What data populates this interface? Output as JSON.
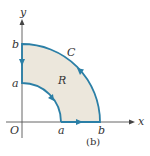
{
  "figure": {
    "caption": "(b)",
    "labels": {
      "y_axis": "y",
      "x_axis": "x",
      "origin": "O",
      "a_x": "a",
      "b_x": "b",
      "a_y": "a",
      "b_y": "b",
      "curve": "C",
      "region": "R"
    },
    "colors": {
      "boundary": "#2b7fa6",
      "region_fill": "#ece7dc",
      "axis": "#555555",
      "text": "#333333"
    },
    "geometry": {
      "origin_px": [
        22,
        122
      ],
      "inner_radius_px": 39,
      "outer_radius_px": 78
    }
  }
}
